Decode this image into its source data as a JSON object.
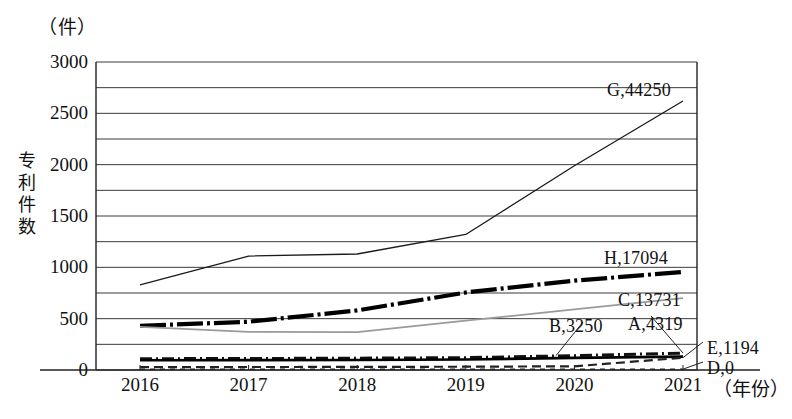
{
  "chart_data": {
    "type": "line",
    "title": "",
    "unit_caption": "（件）",
    "ylabel": "专利件数",
    "ylabel_chars": [
      "专",
      "利",
      "件",
      "数"
    ],
    "xlabel": "（年份）",
    "x": [
      "2016",
      "2017",
      "2018",
      "2019",
      "2020",
      "2021"
    ],
    "xticks": [
      "2016",
      "2017",
      "2018",
      "2019",
      "2020",
      "2021"
    ],
    "yticks": [
      "0",
      "500",
      "1000",
      "1500",
      "2000",
      "2500",
      "3000"
    ],
    "ylim": [
      0,
      3000
    ],
    "ytick_step": 500,
    "gridline_step": 250,
    "grid": true,
    "legend_position": "line-end-labels",
    "series": [
      {
        "name": "G",
        "label": "G,44250",
        "total": 44250,
        "style": "solid-thin",
        "color": "#1a1a1a",
        "values": [
          830,
          1110,
          1130,
          1320,
          1990,
          2620
        ]
      },
      {
        "name": "H",
        "label": "H,17094",
        "total": 17094,
        "style": "dash-dot-thick",
        "color": "#000000",
        "values": [
          430,
          470,
          580,
          755,
          870,
          955
        ]
      },
      {
        "name": "C",
        "label": "C,13731",
        "total": 13731,
        "style": "solid-gray",
        "color": "#9a9a9a",
        "values": [
          420,
          372,
          368,
          480,
          590,
          700
        ]
      },
      {
        "name": "A",
        "label": "A,4319",
        "total": 4319,
        "style": "dash-dot-thin",
        "color": "#111111",
        "values": [
          110,
          112,
          115,
          120,
          140,
          165
        ]
      },
      {
        "name": "B",
        "label": "B,3250",
        "total": 3250,
        "style": "solid-medium",
        "color": "#000000",
        "values": [
          95,
          96,
          98,
          102,
          118,
          130
        ]
      },
      {
        "name": "E",
        "label": "E,1194",
        "total": 1194,
        "style": "dashed-thin",
        "color": "#222222",
        "values": [
          28,
          29,
          30,
          32,
          36,
          120
        ]
      },
      {
        "name": "D",
        "label": "D,0",
        "total": 0,
        "style": "dotted-thin",
        "color": "#222222",
        "values": [
          8,
          8,
          8,
          8,
          8,
          8
        ]
      }
    ],
    "annotations": [
      {
        "text": "G,44250",
        "x": 607,
        "y": 80
      },
      {
        "text": "H,17094",
        "x": 604,
        "y": 248
      },
      {
        "text": "C,13731",
        "x": 618,
        "y": 290
      },
      {
        "text": "A,4319",
        "x": 628,
        "y": 314
      },
      {
        "text": "B,3250",
        "x": 549,
        "y": 316
      },
      {
        "text": "E,1194",
        "x": 707,
        "y": 338
      },
      {
        "text": "D,0",
        "x": 707,
        "y": 358
      }
    ]
  }
}
